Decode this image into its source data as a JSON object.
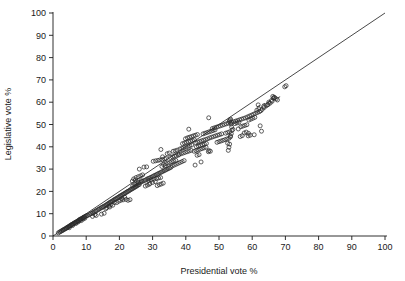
{
  "chart_data": {
    "type": "scatter",
    "title": "",
    "xlabel": "Presidential vote %",
    "ylabel": "Legislative vote %",
    "xlim": [
      0,
      100
    ],
    "ylim": [
      0,
      100
    ],
    "xticks": [
      0,
      10,
      20,
      30,
      40,
      50,
      60,
      70,
      80,
      90,
      100
    ],
    "yticks": [
      0,
      10,
      20,
      30,
      40,
      50,
      60,
      70,
      80,
      90,
      100
    ],
    "xtick_labels": [
      "0",
      "10",
      "20",
      "30",
      "40",
      "50",
      "60",
      "70",
      "80",
      "90",
      "100"
    ],
    "ytick_labels": [
      "0",
      "10",
      "20",
      "30",
      "40",
      "50",
      "60",
      "70",
      "80",
      "90",
      "100"
    ],
    "grid": false,
    "legend": null,
    "marker": "open-circle",
    "marker_color": "#2b2b2b",
    "reference_line": {
      "name": "identity-line",
      "style": "solid",
      "from": [
        0,
        0
      ],
      "to": [
        100,
        100
      ]
    },
    "dashed_segment": {
      "name": "dashed-trend-segment",
      "style": "dashed",
      "from": [
        61.5,
        58.0
      ],
      "to": [
        68.5,
        62.5
      ]
    },
    "points": [
      [
        1.6,
        1.4
      ],
      [
        2.0,
        1.8
      ],
      [
        2.3,
        2.0
      ],
      [
        2.6,
        2.3
      ],
      [
        2.9,
        2.6
      ],
      [
        3.1,
        2.7
      ],
      [
        3.4,
        3.0
      ],
      [
        3.6,
        3.2
      ],
      [
        3.9,
        3.4
      ],
      [
        4.1,
        3.6
      ],
      [
        4.3,
        3.9
      ],
      [
        4.5,
        4.0
      ],
      [
        4.8,
        4.3
      ],
      [
        5.0,
        4.5
      ],
      [
        5.2,
        4.6
      ],
      [
        5.4,
        4.9
      ],
      [
        5.6,
        5.1
      ],
      [
        5.8,
        5.2
      ],
      [
        6.0,
        5.4
      ],
      [
        6.2,
        5.6
      ],
      [
        6.4,
        5.8
      ],
      [
        6.6,
        6.0
      ],
      [
        6.8,
        6.1
      ],
      [
        7.0,
        6.3
      ],
      [
        7.2,
        6.5
      ],
      [
        7.4,
        6.6
      ],
      [
        7.6,
        6.9
      ],
      [
        7.8,
        7.0
      ],
      [
        8.0,
        7.2
      ],
      [
        8.2,
        7.4
      ],
      [
        8.4,
        7.5
      ],
      [
        8.6,
        7.8
      ],
      [
        8.8,
        8.0
      ],
      [
        9.0,
        8.1
      ],
      [
        9.2,
        8.3
      ],
      [
        9.4,
        8.5
      ],
      [
        9.6,
        8.7
      ],
      [
        9.9,
        8.9
      ],
      [
        10.2,
        9.1
      ],
      [
        10.5,
        9.3
      ],
      [
        7.6,
        6.3
      ],
      [
        8.1,
        7.5
      ],
      [
        8.5,
        6.9
      ],
      [
        9.1,
        7.6
      ],
      [
        9.6,
        8.0
      ],
      [
        6.9,
        5.6
      ],
      [
        5.9,
        4.7
      ],
      [
        4.9,
        3.7
      ],
      [
        11.0,
        9.6
      ],
      [
        11.4,
        10.0
      ],
      [
        11.8,
        10.2
      ],
      [
        12.1,
        10.5
      ],
      [
        12.4,
        10.8
      ],
      [
        12.8,
        11.1
      ],
      [
        13.1,
        11.4
      ],
      [
        13.5,
        11.7
      ],
      [
        13.8,
        12.0
      ],
      [
        14.1,
        12.3
      ],
      [
        14.5,
        12.6
      ],
      [
        14.8,
        12.9
      ],
      [
        15.1,
        13.1
      ],
      [
        15.4,
        13.4
      ],
      [
        15.8,
        13.7
      ],
      [
        16.1,
        14.0
      ],
      [
        16.4,
        14.3
      ],
      [
        16.7,
        14.6
      ],
      [
        17.0,
        14.9
      ],
      [
        17.3,
        15.2
      ],
      [
        17.6,
        15.4
      ],
      [
        17.9,
        15.7
      ],
      [
        18.2,
        16.0
      ],
      [
        18.5,
        16.3
      ],
      [
        18.8,
        16.6
      ],
      [
        19.1,
        16.8
      ],
      [
        19.4,
        17.1
      ],
      [
        19.7,
        17.4
      ],
      [
        20.0,
        17.7
      ],
      [
        20.3,
        18.0
      ],
      [
        20.6,
        18.2
      ],
      [
        20.9,
        18.5
      ],
      [
        21.2,
        18.8
      ],
      [
        21.5,
        19.0
      ],
      [
        21.8,
        19.3
      ],
      [
        22.1,
        19.6
      ],
      [
        22.4,
        19.9
      ],
      [
        22.7,
        20.1
      ],
      [
        23.0,
        20.4
      ],
      [
        23.3,
        20.7
      ],
      [
        23.6,
        21.0
      ],
      [
        23.9,
        21.2
      ],
      [
        24.2,
        21.5
      ],
      [
        24.5,
        21.8
      ],
      [
        24.8,
        22.0
      ],
      [
        25.1,
        22.3
      ],
      [
        25.4,
        22.6
      ],
      [
        25.7,
        22.9
      ],
      [
        26.0,
        23.1
      ],
      [
        11.9,
        8.8
      ],
      [
        13.0,
        9.2
      ],
      [
        14.6,
        9.8
      ],
      [
        15.4,
        10.2
      ],
      [
        12.6,
        9.6
      ],
      [
        16.2,
        12.7
      ],
      [
        17.1,
        13.0
      ],
      [
        18.0,
        13.8
      ],
      [
        19.2,
        15.0
      ],
      [
        20.4,
        16.0
      ],
      [
        21.1,
        16.2
      ],
      [
        22.0,
        16.4
      ],
      [
        22.6,
        16.0
      ],
      [
        23.2,
        16.3
      ],
      [
        18.5,
        15.0
      ],
      [
        19.8,
        15.6
      ],
      [
        20.8,
        16.8
      ],
      [
        21.6,
        17.4
      ],
      [
        17.4,
        14.0
      ],
      [
        16.8,
        13.4
      ],
      [
        15.9,
        12.2
      ],
      [
        24.0,
        22.4
      ],
      [
        24.6,
        23.0
      ],
      [
        25.2,
        23.4
      ],
      [
        25.8,
        23.8
      ],
      [
        26.3,
        24.0
      ],
      [
        26.7,
        24.4
      ],
      [
        27.1,
        24.6
      ],
      [
        27.5,
        24.9
      ],
      [
        27.9,
        25.1
      ],
      [
        28.3,
        25.5
      ],
      [
        28.7,
        25.8
      ],
      [
        29.1,
        26.0
      ],
      [
        29.5,
        26.3
      ],
      [
        29.9,
        26.6
      ],
      [
        30.3,
        26.9
      ],
      [
        30.7,
        27.2
      ],
      [
        31.1,
        27.5
      ],
      [
        31.5,
        27.8
      ],
      [
        31.9,
        28.1
      ],
      [
        32.3,
        28.4
      ],
      [
        32.7,
        28.7
      ],
      [
        33.1,
        29.0
      ],
      [
        33.5,
        29.3
      ],
      [
        33.9,
        29.6
      ],
      [
        34.3,
        29.9
      ],
      [
        34.7,
        30.2
      ],
      [
        35.1,
        30.5
      ],
      [
        35.5,
        30.8
      ],
      [
        24.3,
        25.6
      ],
      [
        25.0,
        26.2
      ],
      [
        25.7,
        26.6
      ],
      [
        26.4,
        27.0
      ],
      [
        27.0,
        27.4
      ],
      [
        23.9,
        24.6
      ],
      [
        24.8,
        25.1
      ],
      [
        26.0,
        30.0
      ],
      [
        27.4,
        30.9
      ],
      [
        28.2,
        31.0
      ],
      [
        25.6,
        24.2
      ],
      [
        26.6,
        24.8
      ],
      [
        28.8,
        24.9
      ],
      [
        29.6,
        25.2
      ],
      [
        30.4,
        25.5
      ],
      [
        31.2,
        25.8
      ],
      [
        31.8,
        26.0
      ],
      [
        32.4,
        26.2
      ],
      [
        29.2,
        23.6
      ],
      [
        30.0,
        24.0
      ],
      [
        30.8,
        24.4
      ],
      [
        31.4,
        22.6
      ],
      [
        32.0,
        23.0
      ],
      [
        32.6,
        23.3
      ],
      [
        33.2,
        23.7
      ],
      [
        28.4,
        22.8
      ],
      [
        29.0,
        23.2
      ],
      [
        27.8,
        22.4
      ],
      [
        30.9,
        33.7
      ],
      [
        31.6,
        33.9
      ],
      [
        32.2,
        34.1
      ],
      [
        32.9,
        34.3
      ],
      [
        30.2,
        33.5
      ],
      [
        33.6,
        34.6
      ],
      [
        34.1,
        34.8
      ],
      [
        33.3,
        32.0
      ],
      [
        34.0,
        32.4
      ],
      [
        34.6,
        32.7
      ],
      [
        35.2,
        33.0
      ],
      [
        35.8,
        33.3
      ],
      [
        36.4,
        33.6
      ],
      [
        37.0,
        33.9
      ],
      [
        32.8,
        31.2
      ],
      [
        33.8,
        31.6
      ],
      [
        35.4,
        35.2
      ],
      [
        36.0,
        35.5
      ],
      [
        36.6,
        35.8
      ],
      [
        37.2,
        36.0
      ],
      [
        37.8,
        36.3
      ],
      [
        34.4,
        36.9
      ],
      [
        35.0,
        37.2
      ],
      [
        32.5,
        38.8
      ],
      [
        33.0,
        35.5
      ],
      [
        36.2,
        38.0
      ],
      [
        36.8,
        38.2
      ],
      [
        37.4,
        38.5
      ],
      [
        35.9,
        31.4
      ],
      [
        36.5,
        31.8
      ],
      [
        37.1,
        32.2
      ],
      [
        37.7,
        32.6
      ],
      [
        38.3,
        33.0
      ],
      [
        38.9,
        33.4
      ],
      [
        39.5,
        33.8
      ],
      [
        38.0,
        36.6
      ],
      [
        38.6,
        36.9
      ],
      [
        39.2,
        37.2
      ],
      [
        39.8,
        37.5
      ],
      [
        40.4,
        37.8
      ],
      [
        41.0,
        38.1
      ],
      [
        41.6,
        38.4
      ],
      [
        38.2,
        39.0
      ],
      [
        38.8,
        39.3
      ],
      [
        39.4,
        39.6
      ],
      [
        40.0,
        39.9
      ],
      [
        40.6,
        40.2
      ],
      [
        41.2,
        40.5
      ],
      [
        41.8,
        40.8
      ],
      [
        39.0,
        41.4
      ],
      [
        39.6,
        41.7
      ],
      [
        40.2,
        42.0
      ],
      [
        40.8,
        42.3
      ],
      [
        41.4,
        42.5
      ],
      [
        42.0,
        42.8
      ],
      [
        42.6,
        43.1
      ],
      [
        40.5,
        44.0
      ],
      [
        41.1,
        44.3
      ],
      [
        41.7,
        44.6
      ],
      [
        39.9,
        43.6
      ],
      [
        42.3,
        44.9
      ],
      [
        42.9,
        45.2
      ],
      [
        43.5,
        45.5
      ],
      [
        40.9,
        47.9
      ],
      [
        43.2,
        40.0
      ],
      [
        43.8,
        40.3
      ],
      [
        44.4,
        40.6
      ],
      [
        45.0,
        40.9
      ],
      [
        45.6,
        41.2
      ],
      [
        46.2,
        41.5
      ],
      [
        42.5,
        38.0
      ],
      [
        43.1,
        38.3
      ],
      [
        43.7,
        38.6
      ],
      [
        44.3,
        38.9
      ],
      [
        44.9,
        39.2
      ],
      [
        45.5,
        39.5
      ],
      [
        46.1,
        39.8
      ],
      [
        43.4,
        36.2
      ],
      [
        44.0,
        36.5
      ],
      [
        44.6,
        33.2
      ],
      [
        42.8,
        31.8
      ],
      [
        46.8,
        37.8
      ],
      [
        47.4,
        38.0
      ],
      [
        47.0,
        38.3
      ],
      [
        43.0,
        41.8
      ],
      [
        43.6,
        42.1
      ],
      [
        44.2,
        42.4
      ],
      [
        44.8,
        42.7
      ],
      [
        45.4,
        43.0
      ],
      [
        46.0,
        43.3
      ],
      [
        46.6,
        43.6
      ],
      [
        45.2,
        45.8
      ],
      [
        45.8,
        46.1
      ],
      [
        46.4,
        46.4
      ],
      [
        47.0,
        46.7
      ],
      [
        47.6,
        47.0
      ],
      [
        48.2,
        47.3
      ],
      [
        48.8,
        47.6
      ],
      [
        47.2,
        44.0
      ],
      [
        47.8,
        44.3
      ],
      [
        48.4,
        44.6
      ],
      [
        49.0,
        44.9
      ],
      [
        49.6,
        45.2
      ],
      [
        50.2,
        45.5
      ],
      [
        50.8,
        45.8
      ],
      [
        46.9,
        53.0
      ],
      [
        48.0,
        48.2
      ],
      [
        48.6,
        48.5
      ],
      [
        49.2,
        48.8
      ],
      [
        49.8,
        49.1
      ],
      [
        50.4,
        49.4
      ],
      [
        51.0,
        49.7
      ],
      [
        49.4,
        42.0
      ],
      [
        50.0,
        42.3
      ],
      [
        50.6,
        42.6
      ],
      [
        51.2,
        42.9
      ],
      [
        51.8,
        43.2
      ],
      [
        52.4,
        43.5
      ],
      [
        53.0,
        43.8
      ],
      [
        51.6,
        50.0
      ],
      [
        52.2,
        50.3
      ],
      [
        52.8,
        50.6
      ],
      [
        53.4,
        50.9
      ],
      [
        52.0,
        46.1
      ],
      [
        52.6,
        46.4
      ],
      [
        53.2,
        46.7
      ],
      [
        53.1,
        51.5
      ],
      [
        53.3,
        52.0
      ],
      [
        53.5,
        52.4
      ],
      [
        53.6,
        50.2
      ],
      [
        53.8,
        48.8
      ],
      [
        53.9,
        47.4
      ],
      [
        53.7,
        45.9
      ],
      [
        53.4,
        44.4
      ],
      [
        53.2,
        41.2
      ],
      [
        53.0,
        39.8
      ],
      [
        52.8,
        38.4
      ],
      [
        52.6,
        41.6
      ],
      [
        53.5,
        44.8
      ],
      [
        53.8,
        51.0
      ],
      [
        54.4,
        51.2
      ],
      [
        55.0,
        51.5
      ],
      [
        55.6,
        51.8
      ],
      [
        56.2,
        52.1
      ],
      [
        56.8,
        52.4
      ],
      [
        57.4,
        52.7
      ],
      [
        58.0,
        53.0
      ],
      [
        54.8,
        50.4
      ],
      [
        55.4,
        50.7
      ],
      [
        56.0,
        51.0
      ],
      [
        56.6,
        49.0
      ],
      [
        57.2,
        49.3
      ],
      [
        57.8,
        49.6
      ],
      [
        58.4,
        49.9
      ],
      [
        54.2,
        47.8
      ],
      [
        55.8,
        48.0
      ],
      [
        56.4,
        44.6
      ],
      [
        57.0,
        45.0
      ],
      [
        57.6,
        46.2
      ],
      [
        58.2,
        46.6
      ],
      [
        58.8,
        44.9
      ],
      [
        58.6,
        53.4
      ],
      [
        59.2,
        53.8
      ],
      [
        59.8,
        54.2
      ],
      [
        60.4,
        54.6
      ],
      [
        61.0,
        55.0
      ],
      [
        61.6,
        55.4
      ],
      [
        62.2,
        55.8
      ],
      [
        59.0,
        52.0
      ],
      [
        59.6,
        52.4
      ],
      [
        60.2,
        52.8
      ],
      [
        60.8,
        53.2
      ],
      [
        61.4,
        56.4
      ],
      [
        61.8,
        58.8
      ],
      [
        62.0,
        57.0
      ],
      [
        62.6,
        56.2
      ],
      [
        62.8,
        47.0
      ],
      [
        58.9,
        46.0
      ],
      [
        59.4,
        45.2
      ],
      [
        60.6,
        45.4
      ],
      [
        62.4,
        49.4
      ],
      [
        63.0,
        56.8
      ],
      [
        63.6,
        57.6
      ],
      [
        64.2,
        58.4
      ],
      [
        64.8,
        59.0
      ],
      [
        65.4,
        59.6
      ],
      [
        66.0,
        60.4
      ],
      [
        66.4,
        61.8
      ],
      [
        66.6,
        62.2
      ],
      [
        66.8,
        62.0
      ],
      [
        67.2,
        61.5
      ],
      [
        67.6,
        61.0
      ],
      [
        65.0,
        60.0
      ],
      [
        65.8,
        60.8
      ],
      [
        63.4,
        58.0
      ],
      [
        64.6,
        58.8
      ],
      [
        70.2,
        67.4
      ],
      [
        69.8,
        66.9
      ],
      [
        66.2,
        62.6
      ]
    ]
  }
}
